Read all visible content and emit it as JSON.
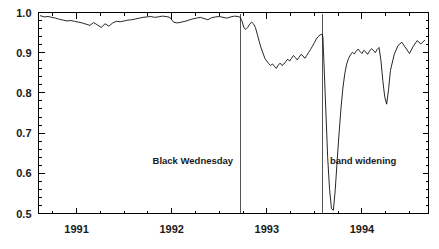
{
  "chart_data": {
    "type": "line",
    "title": "",
    "subtitle": "",
    "xlabel": "",
    "ylabel": "",
    "xlim": [
      1990.6,
      1994.7
    ],
    "ylim": [
      0.5,
      1.0
    ],
    "grid": false,
    "legend": "none",
    "x_tick_labels": [
      "1991",
      "1992",
      "1993",
      "1994"
    ],
    "x_tick_values": [
      1991,
      1992,
      1993,
      1994
    ],
    "x_minor_interval": 0.25,
    "y_tick_labels": [
      "1.0",
      "0.9",
      "0.8",
      "0.7",
      "0.6",
      "0.5"
    ],
    "y_tick_values": [
      1.0,
      0.9,
      0.8,
      0.7,
      0.6,
      0.5
    ],
    "y_minor_interval": 0.02,
    "annotations": [
      {
        "label": "Black Wednesday",
        "x": 1992.72,
        "line": true
      },
      {
        "label": "band widening",
        "x": 1993.59,
        "line": true
      }
    ],
    "series": [
      {
        "name": "exchange rate index",
        "color": "#000000",
        "x": [
          1990.62,
          1990.66,
          1990.7,
          1990.74,
          1990.78,
          1990.82,
          1990.86,
          1990.9,
          1990.94,
          1990.98,
          1991.02,
          1991.06,
          1991.1,
          1991.14,
          1991.18,
          1991.22,
          1991.26,
          1991.3,
          1991.34,
          1991.38,
          1991.42,
          1991.46,
          1991.5,
          1991.54,
          1991.58,
          1991.62,
          1991.66,
          1991.7,
          1991.74,
          1991.78,
          1991.82,
          1991.86,
          1991.9,
          1991.94,
          1991.98,
          1992.02,
          1992.06,
          1992.1,
          1992.14,
          1992.18,
          1992.22,
          1992.26,
          1992.3,
          1992.34,
          1992.38,
          1992.42,
          1992.46,
          1992.5,
          1992.54,
          1992.58,
          1992.62,
          1992.66,
          1992.7,
          1992.72,
          1992.74,
          1992.76,
          1992.78,
          1992.8,
          1992.82,
          1992.84,
          1992.86,
          1992.88,
          1992.9,
          1992.92,
          1992.94,
          1992.96,
          1992.98,
          1993.0,
          1993.02,
          1993.04,
          1993.06,
          1993.08,
          1993.1,
          1993.12,
          1993.14,
          1993.16,
          1993.18,
          1993.2,
          1993.22,
          1993.24,
          1993.26,
          1993.28,
          1993.3,
          1993.32,
          1993.34,
          1993.36,
          1993.38,
          1993.4,
          1993.42,
          1993.44,
          1993.46,
          1993.48,
          1993.5,
          1993.52,
          1993.54,
          1993.56,
          1993.58,
          1993.585,
          1993.59,
          1993.6,
          1993.62,
          1993.64,
          1993.66,
          1993.68,
          1993.7,
          1993.72,
          1993.74,
          1993.76,
          1993.78,
          1993.8,
          1993.82,
          1993.84,
          1993.86,
          1993.88,
          1993.9,
          1993.92,
          1993.94,
          1993.96,
          1993.98,
          1994.0,
          1994.02,
          1994.04,
          1994.06,
          1994.08,
          1994.1,
          1994.12,
          1994.14,
          1994.16,
          1994.18,
          1994.2,
          1994.22,
          1994.24,
          1994.26,
          1994.28,
          1994.3,
          1994.34,
          1994.38,
          1994.42,
          1994.46,
          1994.5,
          1994.54,
          1994.58,
          1994.62,
          1994.66
        ],
        "y": [
          0.992,
          0.989,
          0.99,
          0.988,
          0.986,
          0.983,
          0.981,
          0.979,
          0.98,
          0.978,
          0.976,
          0.974,
          0.971,
          0.968,
          0.975,
          0.969,
          0.963,
          0.972,
          0.966,
          0.974,
          0.978,
          0.977,
          0.979,
          0.981,
          0.982,
          0.984,
          0.986,
          0.988,
          0.989,
          0.99,
          0.988,
          0.989,
          0.991,
          0.99,
          0.988,
          0.976,
          0.974,
          0.976,
          0.978,
          0.981,
          0.984,
          0.986,
          0.988,
          0.985,
          0.982,
          0.987,
          0.989,
          0.99,
          0.988,
          0.986,
          0.989,
          0.991,
          0.99,
          0.988,
          0.978,
          0.962,
          0.958,
          0.963,
          0.971,
          0.976,
          0.972,
          0.963,
          0.946,
          0.928,
          0.912,
          0.899,
          0.886,
          0.879,
          0.873,
          0.868,
          0.872,
          0.866,
          0.861,
          0.869,
          0.874,
          0.868,
          0.872,
          0.878,
          0.884,
          0.879,
          0.886,
          0.893,
          0.888,
          0.882,
          0.889,
          0.896,
          0.892,
          0.886,
          0.893,
          0.901,
          0.908,
          0.916,
          0.925,
          0.934,
          0.94,
          0.944,
          0.946,
          0.944,
          0.938,
          0.88,
          0.76,
          0.64,
          0.56,
          0.512,
          0.508,
          0.56,
          0.632,
          0.7,
          0.762,
          0.812,
          0.848,
          0.872,
          0.886,
          0.895,
          0.901,
          0.897,
          0.904,
          0.909,
          0.903,
          0.898,
          0.906,
          0.902,
          0.896,
          0.904,
          0.91,
          0.906,
          0.9,
          0.908,
          0.913,
          0.88,
          0.83,
          0.79,
          0.772,
          0.808,
          0.856,
          0.896,
          0.918,
          0.926,
          0.912,
          0.898,
          0.916,
          0.93,
          0.922,
          0.931
        ]
      }
    ]
  }
}
